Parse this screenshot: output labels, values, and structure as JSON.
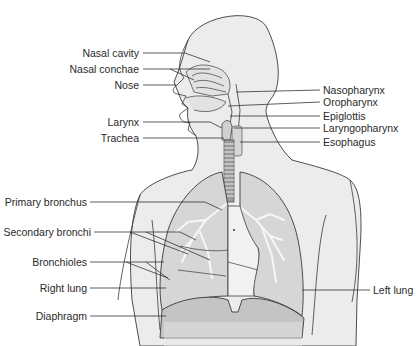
{
  "diagram": {
    "colors": {
      "skin": "#ececec",
      "outline": "#3a3a3a",
      "lung": "#d6d6d6",
      "lung_lower": "#c4c4c4",
      "airway_highlight": "#f7f7f7",
      "trachea": "#9a9a9a",
      "leader_line": "#333333"
    },
    "labels_left": [
      {
        "id": "nasal-cavity",
        "text": "Nasal cavity"
      },
      {
        "id": "nasal-conchae",
        "text": "Nasal conchae"
      },
      {
        "id": "nose",
        "text": "Nose"
      },
      {
        "id": "larynx",
        "text": "Larynx"
      },
      {
        "id": "trachea",
        "text": "Trachea"
      },
      {
        "id": "primary-bronchus",
        "text": "Primary bronchus"
      },
      {
        "id": "secondary-bronchi",
        "text": "Secondary bronchi"
      },
      {
        "id": "bronchioles",
        "text": "Bronchioles"
      },
      {
        "id": "right-lung",
        "text": "Right lung"
      },
      {
        "id": "diaphragm",
        "text": "Diaphragm"
      }
    ],
    "labels_right": [
      {
        "id": "nasopharynx",
        "text": "Nasopharynx"
      },
      {
        "id": "oropharynx",
        "text": "Oropharynx"
      },
      {
        "id": "epiglottis",
        "text": "Epiglottis"
      },
      {
        "id": "laryngopharynx",
        "text": "Laryngopharynx"
      },
      {
        "id": "esophagus",
        "text": "Esophagus"
      },
      {
        "id": "left-lung",
        "text": "Left lung"
      }
    ]
  }
}
